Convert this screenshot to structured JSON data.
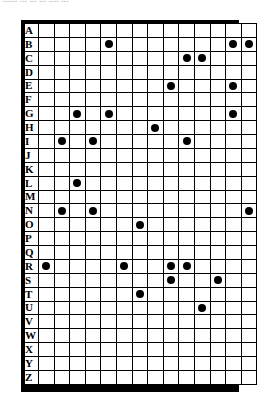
{
  "caption": {
    "text": "...... ... ... ... .... ..."
  },
  "grid": {
    "columns": 14,
    "row_labels": [
      "A",
      "B",
      "C",
      "D",
      "E",
      "F",
      "G",
      "H",
      "I",
      "J",
      "K",
      "L",
      "M",
      "N",
      "O",
      "P",
      "Q",
      "R",
      "S",
      "T",
      "U",
      "V",
      "W",
      "X",
      "Y",
      "Z"
    ],
    "dot_color": "#000000",
    "border_color": "#000000",
    "background_color": "#ffffff"
  },
  "chart_data": {
    "type": "scatter",
    "title": "",
    "xlabel": "",
    "ylabel": "",
    "grid": true,
    "legend": null,
    "x": [
      1,
      2,
      3,
      4,
      5,
      6,
      7,
      8,
      9,
      10,
      11,
      12,
      13,
      14
    ],
    "categories": [
      "A",
      "B",
      "C",
      "D",
      "E",
      "F",
      "G",
      "H",
      "I",
      "J",
      "K",
      "L",
      "M",
      "N",
      "O",
      "P",
      "Q",
      "R",
      "S",
      "T",
      "U",
      "V",
      "W",
      "X",
      "Y",
      "Z"
    ],
    "points": [
      {
        "row": "B",
        "col": 5
      },
      {
        "row": "B",
        "col": 13
      },
      {
        "row": "B",
        "col": 14
      },
      {
        "row": "C",
        "col": 10
      },
      {
        "row": "C",
        "col": 11
      },
      {
        "row": "E",
        "col": 9
      },
      {
        "row": "E",
        "col": 13
      },
      {
        "row": "G",
        "col": 3
      },
      {
        "row": "G",
        "col": 5
      },
      {
        "row": "G",
        "col": 13
      },
      {
        "row": "H",
        "col": 8
      },
      {
        "row": "I",
        "col": 2
      },
      {
        "row": "I",
        "col": 4
      },
      {
        "row": "I",
        "col": 10
      },
      {
        "row": "L",
        "col": 3
      },
      {
        "row": "N",
        "col": 2
      },
      {
        "row": "N",
        "col": 4
      },
      {
        "row": "N",
        "col": 14
      },
      {
        "row": "O",
        "col": 7
      },
      {
        "row": "R",
        "col": 1
      },
      {
        "row": "R",
        "col": 6
      },
      {
        "row": "R",
        "col": 9
      },
      {
        "row": "R",
        "col": 10
      },
      {
        "row": "S",
        "col": 9
      },
      {
        "row": "S",
        "col": 12
      },
      {
        "row": "T",
        "col": 7
      },
      {
        "row": "U",
        "col": 11
      }
    ],
    "rows": {
      "A": [],
      "B": [
        5,
        13,
        14
      ],
      "C": [
        10,
        11
      ],
      "D": [],
      "E": [
        9,
        13
      ],
      "F": [],
      "G": [
        3,
        5,
        13
      ],
      "H": [
        8
      ],
      "I": [
        2,
        4,
        10
      ],
      "J": [],
      "K": [],
      "L": [
        3
      ],
      "M": [],
      "N": [
        2,
        4,
        14
      ],
      "O": [
        7
      ],
      "P": [],
      "Q": [],
      "R": [
        1,
        6,
        9,
        10
      ],
      "S": [
        9,
        12
      ],
      "T": [
        7
      ],
      "U": [
        11
      ],
      "V": [],
      "W": [],
      "X": [],
      "Y": [],
      "Z": []
    },
    "total_points": 27
  }
}
